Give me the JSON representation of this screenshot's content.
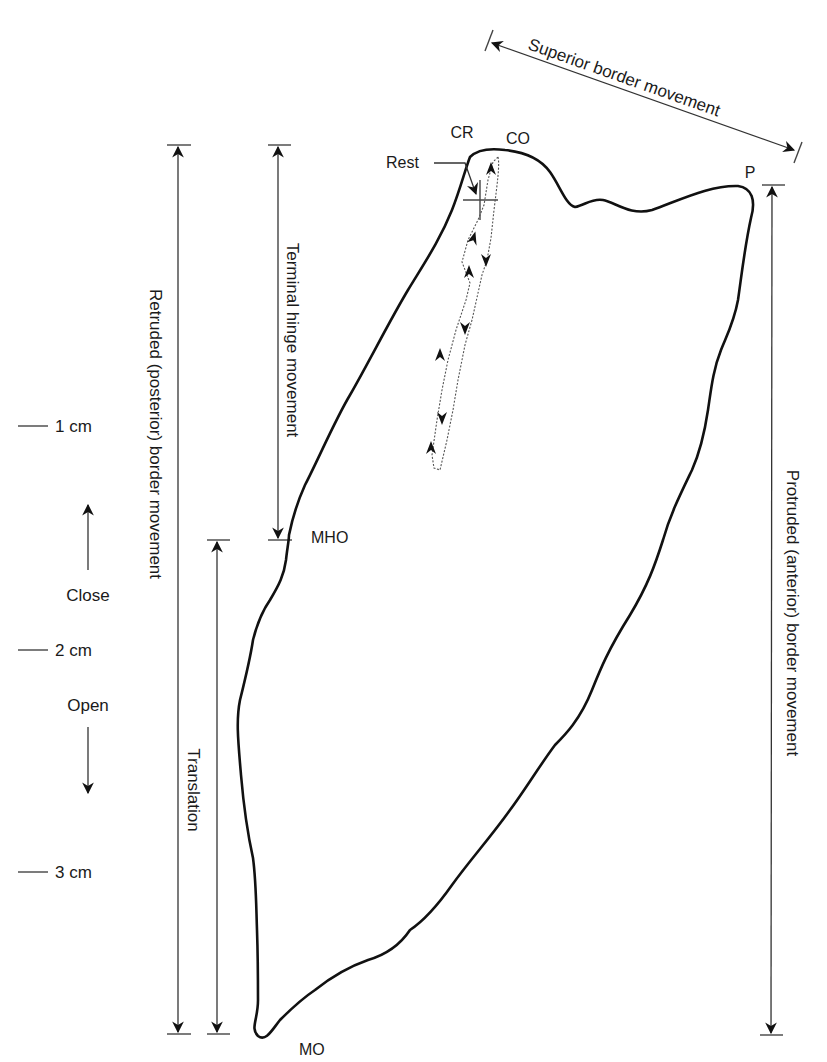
{
  "figure": {
    "labels": {
      "superior": "Superior border movement",
      "retruded": "Retruded (posterior) border movement",
      "terminal_hinge": "Terminal hinge movement",
      "translation": "Translation",
      "protruded": "Protruded (anterior) border movement",
      "cr": "CR",
      "co": "CO",
      "rest": "Rest",
      "p": "P",
      "mho": "MHO",
      "mo": "MO"
    },
    "scale": {
      "ticks": [
        {
          "label": "1 cm",
          "y": 426
        },
        {
          "label": "2 cm",
          "y": 650
        },
        {
          "label": "3 cm",
          "y": 872
        }
      ],
      "close_label": "Close",
      "open_label": "Open"
    },
    "colors": {
      "line": "#111111",
      "background": "#ffffff",
      "dotted_path": "#555555"
    }
  }
}
